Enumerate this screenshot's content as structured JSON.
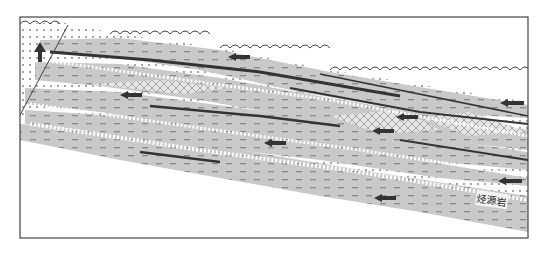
{
  "diagram": {
    "type": "geological cross-section (hydrocarbon migration)",
    "frame": {
      "x": 20,
      "y": 17,
      "width": 508,
      "height": 221
    },
    "labels": {
      "source_rock": "烃源岩"
    },
    "legend_elements": [
      {
        "name": "sandstone",
        "pattern": "dots"
      },
      {
        "name": "mudstone",
        "pattern": "grey with dashes"
      },
      {
        "name": "unconformity",
        "pattern": "wavy line"
      },
      {
        "name": "carbonate/crosshatch",
        "pattern": "cross-hatched lenses"
      },
      {
        "name": "migration-arrow",
        "pattern": "dark arrow"
      },
      {
        "name": "fault",
        "pattern": "straight line"
      }
    ],
    "arrows": [
      {
        "x": 40,
        "y": 52,
        "dir": "up"
      },
      {
        "x": 240,
        "y": 57,
        "dir": "left"
      },
      {
        "x": 138,
        "y": 95,
        "dir": "left"
      },
      {
        "x": 410,
        "y": 117,
        "dir": "left"
      },
      {
        "x": 515,
        "y": 103,
        "dir": "left"
      },
      {
        "x": 383,
        "y": 131,
        "dir": "left"
      },
      {
        "x": 278,
        "y": 143,
        "dir": "left"
      },
      {
        "x": 512,
        "y": 181,
        "dir": "left"
      },
      {
        "x": 395,
        "y": 198,
        "dir": "left"
      }
    ],
    "colors": {
      "mudstone": "#c9c9c9",
      "dash": "#8a8a8a",
      "arrow": "#333333",
      "frame": "#444444",
      "sand": "#ffffff",
      "dot": "#333333"
    }
  }
}
